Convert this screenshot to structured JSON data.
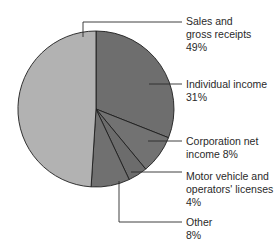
{
  "chart_data": {
    "type": "pie",
    "title": "",
    "start_angle": "12 o'clock",
    "direction": "clockwise",
    "slices": [
      {
        "label": "Individual income",
        "value": 31,
        "color": "#6e6e6e"
      },
      {
        "label": "Corporation net income",
        "value": 8,
        "color": "#727272"
      },
      {
        "label": "Motor vehicle and operators' licenses",
        "value": 4,
        "color": "#6c6c6c"
      },
      {
        "label": "Other",
        "value": 8,
        "color": "#707070"
      },
      {
        "label": "Sales and gross receipts",
        "value": 49,
        "color": "#b2b2b2"
      }
    ],
    "annotations": [
      {
        "text": "Sales and\ngross receipts\n49%"
      },
      {
        "text": "Individual income\n31%"
      },
      {
        "text": "Corporation net\nincome 8%"
      },
      {
        "text": "Motor vehicle and\noperators' licenses\n4%"
      },
      {
        "text": "Other\n8%"
      }
    ]
  },
  "labels": {
    "sales": "Sales and\ngross receipts\n49%",
    "individual": "Individual income\n31%",
    "corporation": "Corporation net\nincome 8%",
    "motor": "Motor vehicle and\noperators' licenses\n4%",
    "other": "Other\n8%"
  }
}
